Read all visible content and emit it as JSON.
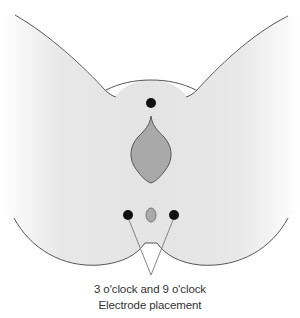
{
  "diagram": {
    "type": "anatomical-schematic",
    "colors": {
      "skin_fill": "#e6e6e6",
      "outline": "#555555",
      "organ_fill": "#a9a9a9",
      "small_oval_fill": "#aaaaaa",
      "electrode_dot": "#111111",
      "leader_line": "#777777",
      "background": "#ffffff"
    },
    "electrodes": [
      {
        "label": "top",
        "cx": 151,
        "cy": 103
      },
      {
        "label": "9 o'clock",
        "cx": 128,
        "cy": 215
      },
      {
        "label": "3 o'clock",
        "cx": 174,
        "cy": 215
      }
    ],
    "leader_convergence": {
      "x": 151,
      "y": 275
    },
    "caption": {
      "line1": "3 o'clock and 9 o'clock",
      "line2": "Electrode placement"
    }
  }
}
